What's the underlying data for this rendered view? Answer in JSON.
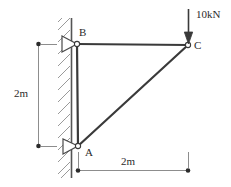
{
  "figure": {
    "stroke_color": "#3a3a3a",
    "hatch_color": "#9a9a9a",
    "text_color": "#2b2b2b"
  },
  "joints": [
    {
      "id": "B",
      "label": "B",
      "x": 77,
      "y": 44
    },
    {
      "id": "C",
      "label": "C",
      "x": 188,
      "y": 45
    },
    {
      "id": "A",
      "label": "A",
      "x": 78,
      "y": 146
    }
  ],
  "members": [
    {
      "name": "top-chord",
      "from": "B",
      "to": "C"
    },
    {
      "name": "vertical-member",
      "from": "A",
      "to": "B"
    },
    {
      "name": "diagonal-member",
      "from": "A",
      "to": "C"
    }
  ],
  "supports": [
    {
      "name": "pin-support-B",
      "at": "B",
      "type": "pin"
    },
    {
      "name": "pin-support-A",
      "at": "A",
      "type": "pin"
    }
  ],
  "wall": {
    "name": "hatched-wall",
    "x_left": 58,
    "x_right": 72,
    "y_top": 18,
    "y_bottom": 178
  },
  "load": {
    "label": "10kN",
    "magnitude": 10,
    "unit": "kN",
    "direction": "down",
    "applied_at": "C"
  },
  "dimensions": [
    {
      "name": "dimension-vertical",
      "label": "2m",
      "value": 2,
      "unit": "m",
      "orientation": "vertical"
    },
    {
      "name": "dimension-horizontal",
      "label": "2m",
      "value": 2,
      "unit": "m",
      "orientation": "horizontal"
    }
  ]
}
